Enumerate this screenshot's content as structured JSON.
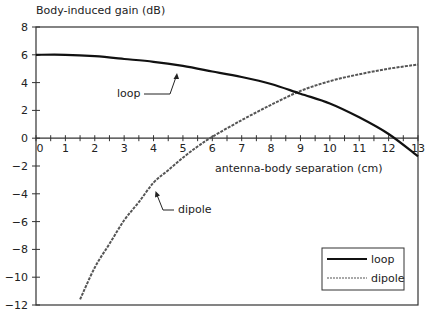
{
  "chart_data": {
    "type": "line",
    "title": "",
    "ylabel": "Body-induced gain (dB)",
    "xlabel": "antenna-body separation (cm)",
    "xlim": [
      0,
      13
    ],
    "ylim": [
      -12,
      8
    ],
    "x_ticks": [
      "0",
      "1",
      "2",
      "3",
      "4",
      "5",
      "6",
      "7",
      "8",
      "9",
      "10",
      "11",
      "12",
      "13"
    ],
    "y_ticks": [
      "8",
      "6",
      "4",
      "2",
      "0",
      "−2",
      "−4",
      "−6",
      "−8",
      "−10",
      "−12"
    ],
    "grid": false,
    "legend_position": "lower right",
    "series": [
      {
        "name": "loop",
        "style": "solid",
        "x": [
          0,
          1,
          2,
          3,
          4,
          5,
          6,
          7,
          8,
          9,
          10,
          11,
          12,
          13
        ],
        "values": [
          6.0,
          6.0,
          5.9,
          5.7,
          5.5,
          5.2,
          4.8,
          4.4,
          3.9,
          3.2,
          2.5,
          1.5,
          0.3,
          -1.3
        ]
      },
      {
        "name": "dipole",
        "style": "dashed",
        "x": [
          1.5,
          2,
          2.5,
          3,
          3.5,
          4,
          4.5,
          5,
          5.5,
          6,
          7,
          8,
          9,
          10,
          11,
          12,
          13
        ],
        "values": [
          -11.6,
          -9.3,
          -7.6,
          -5.9,
          -4.6,
          -3.2,
          -2.3,
          -1.4,
          -0.6,
          0.1,
          1.3,
          2.4,
          3.4,
          4.1,
          4.6,
          5.0,
          5.3
        ]
      }
    ],
    "annotations": [
      {
        "text": "loop",
        "points_to": "loop"
      },
      {
        "text": "dipole",
        "points_to": "dipole"
      }
    ]
  },
  "labels": {
    "ylabel": "Body-induced gain (dB)",
    "xlabel": "antenna-body separation (cm)",
    "loop_annot": "loop",
    "dipole_annot": "dipole",
    "legend_loop": "loop",
    "legend_dipole": "dipole"
  }
}
